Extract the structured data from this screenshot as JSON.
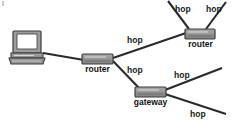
{
  "diagram": {
    "type": "network-topology",
    "background_color": "#ffffff",
    "line_color": "#2b2b2b",
    "device_fill_top": "#9a9a9a",
    "device_fill_bottom": "#8c8c8c",
    "device_stroke": "#3d3d3d",
    "nodes": [
      {
        "id": "laptop",
        "kind": "laptop",
        "label": "",
        "x": 10,
        "y": 31,
        "w": 34,
        "h": 33
      },
      {
        "id": "router-left",
        "kind": "router",
        "label": "router",
        "x": 82,
        "y": 54,
        "w": 31,
        "h": 10,
        "label_x": 80,
        "label_y": 65
      },
      {
        "id": "router-right",
        "kind": "router",
        "label": "router",
        "x": 185,
        "y": 29,
        "w": 30,
        "h": 10,
        "label_x": 183,
        "label_y": 40
      },
      {
        "id": "gateway",
        "kind": "gateway",
        "label": "gateway",
        "x": 135,
        "y": 87,
        "w": 31,
        "h": 10,
        "label_x": 128,
        "label_y": 98
      }
    ],
    "edges": [
      {
        "id": "laptop-to-router-left",
        "from": "laptop",
        "to": "router-left",
        "label": ""
      },
      {
        "id": "router-left-to-router-right",
        "from": "router-left",
        "to": "router-right",
        "label": "hop"
      },
      {
        "id": "router-left-to-gateway",
        "from": "router-left",
        "to": "gateway",
        "label": "hop"
      },
      {
        "id": "router-right-hop-upper-left",
        "from": "router-right",
        "to": "cloud",
        "label": "hop"
      },
      {
        "id": "router-right-hop-upper-right",
        "from": "router-right",
        "to": "cloud",
        "label": "hop"
      },
      {
        "id": "gateway-hop-upper-right",
        "from": "gateway",
        "to": "cloud",
        "label": "hop"
      },
      {
        "id": "gateway-hop-lower-right",
        "from": "gateway",
        "to": "cloud",
        "label": "hop"
      }
    ],
    "edge_labels": [
      {
        "id": "hop-router-to-router",
        "text": "hop",
        "x": 127,
        "y": 36
      },
      {
        "id": "hop-router-to-gateway",
        "text": "hop",
        "x": 127,
        "y": 66
      },
      {
        "id": "hop-top-left",
        "text": "hop",
        "x": 175,
        "y": 5
      },
      {
        "id": "hop-top-right",
        "text": "hop",
        "x": 206,
        "y": 5
      },
      {
        "id": "hop-gateway-upper",
        "text": "hop",
        "x": 174,
        "y": 71
      },
      {
        "id": "hop-gateway-lower",
        "text": "hop",
        "x": 190,
        "y": 110
      }
    ]
  }
}
